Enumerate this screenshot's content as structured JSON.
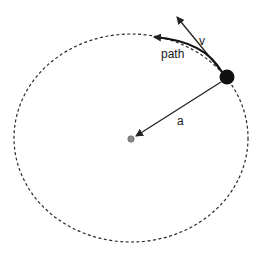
{
  "diagram": {
    "labels": {
      "velocity": "v",
      "path": "path",
      "acceleration": "a"
    },
    "colors": {
      "orbit": "#2a2a2a",
      "ball": "#111111",
      "center": "#777777",
      "arrow": "#222222"
    }
  }
}
